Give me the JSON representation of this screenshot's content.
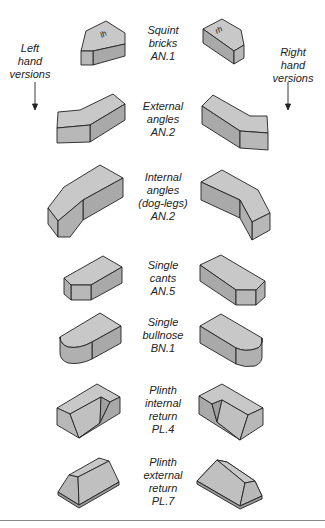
{
  "side_labels": {
    "left": [
      "Left",
      "hand",
      "versions"
    ],
    "right": [
      "Right",
      "hand",
      "versions"
    ]
  },
  "bricks": [
    {
      "name": "squint-bricks",
      "lines": [
        "Squint",
        "bricks",
        "AN.1"
      ],
      "left_mark": "lh",
      "right_mark": "rh"
    },
    {
      "name": "external-angles",
      "lines": [
        "External",
        "angles",
        "AN.2"
      ]
    },
    {
      "name": "internal-angles",
      "lines": [
        "Internal",
        "angles",
        "(dog-legs)",
        "AN.2"
      ]
    },
    {
      "name": "single-cants",
      "lines": [
        "Single",
        "cants",
        "AN.5"
      ]
    },
    {
      "name": "single-bullnose",
      "lines": [
        "Single",
        "bullnose",
        "BN.1"
      ]
    },
    {
      "name": "plinth-internal-return",
      "lines": [
        "Plinth",
        "internal",
        "return",
        "PL.4"
      ]
    },
    {
      "name": "plinth-external-return",
      "lines": [
        "Plinth",
        "external",
        "return",
        "PL.7"
      ]
    }
  ],
  "colors": {
    "top_face": "#c8c8c8",
    "side_face": "#a9a9a9",
    "end_face": "#b8b8b8",
    "outline": "#222222"
  }
}
